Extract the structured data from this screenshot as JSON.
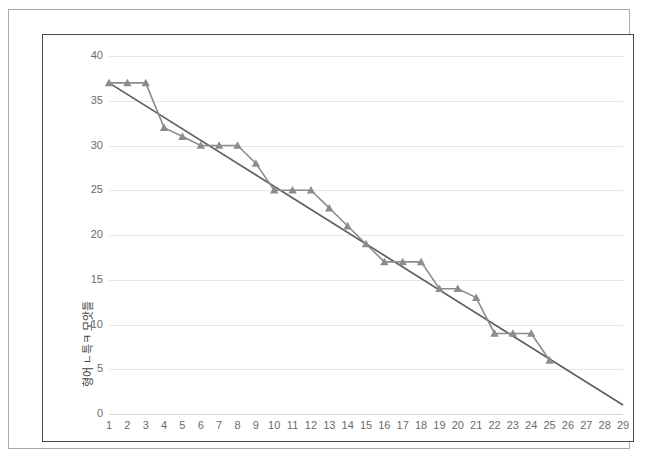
{
  "chart_data": {
    "type": "line",
    "title": "",
    "subtitle": "",
    "xlabel": "",
    "ylabel": "형어 ㄴ특ㅋ 모앗틀",
    "ylim": [
      0,
      40
    ],
    "xlim": [
      1,
      29
    ],
    "grid": true,
    "legend": "none",
    "y_ticks": [
      0,
      5,
      10,
      15,
      20,
      25,
      30,
      35,
      40
    ],
    "x_ticks": [
      1,
      2,
      3,
      4,
      5,
      6,
      7,
      8,
      9,
      10,
      11,
      12,
      13,
      14,
      15,
      16,
      17,
      18,
      19,
      20,
      21,
      22,
      23,
      24,
      25,
      26,
      27,
      28,
      29
    ],
    "categories": [
      1,
      2,
      3,
      4,
      5,
      6,
      7,
      8,
      9,
      10,
      11,
      12,
      13,
      14,
      15,
      16,
      17,
      18,
      19,
      20,
      21,
      22,
      23,
      24,
      25
    ],
    "series": [
      {
        "name": "data",
        "marker": "triangle",
        "color": "#8c8c8c",
        "values": [
          37,
          37,
          37,
          32,
          31,
          30,
          30,
          30,
          28,
          25,
          25,
          25,
          23,
          21,
          19,
          17,
          17,
          17,
          14,
          14,
          13,
          9,
          9,
          9,
          6
        ]
      },
      {
        "name": "trendline",
        "marker": "none",
        "color": "#5e5e5e",
        "x_start": 1,
        "y_start": 37,
        "x_end": 29,
        "y_end": 1
      }
    ]
  },
  "colors": {
    "series": "#8c8c8c",
    "trendline": "#5e5e5e",
    "gridline": "#e6e6e6",
    "tick_text": "#6b6b6b",
    "axis_title": "#3f3f3f",
    "chart_border": "#4a4a4a",
    "page_border": "#a9a9a9",
    "background": "#ffffff"
  }
}
